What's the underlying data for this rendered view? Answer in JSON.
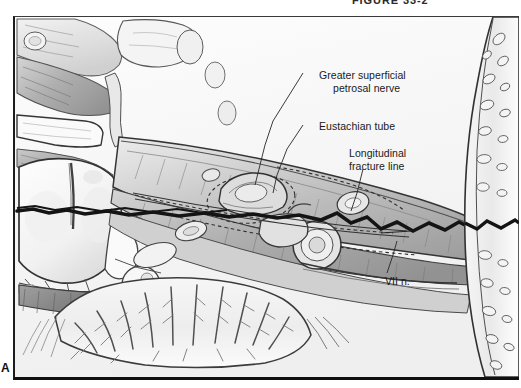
{
  "figure": {
    "header": "FIGURE 33-2",
    "panel_letter": "A"
  },
  "illustration": {
    "title": "Temporal bone longitudinal fracture, superior view",
    "annotations": [
      {
        "id": "gspn",
        "line1": "Greater superficial",
        "line2": "petrosal nerve"
      },
      {
        "id": "eustachian",
        "line1": "Eustachian tube",
        "line2": ""
      },
      {
        "id": "fracture",
        "line1": "Longitudinal",
        "line2": "fracture line"
      },
      {
        "id": "facial_nerve",
        "line1": "VII n.",
        "line2": ""
      }
    ],
    "colors": {
      "ink": "#1a1a1a",
      "fracture": "#0d0d0d",
      "paper": "#fbfbfb",
      "shade_light": "#e3e3e3",
      "shade_mid": "#b9b9b9",
      "shade_dark": "#8a8a8a",
      "shade_darkest": "#5a5a5a"
    }
  }
}
